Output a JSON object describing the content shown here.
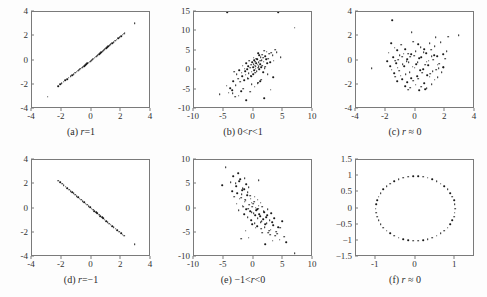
{
  "figure": {
    "background_color": "#fdfdfd",
    "frame_color": "#7a7a7a",
    "point_color": "#1a1a1a",
    "panel_count": 6
  },
  "chart_data": [
    {
      "type": "scatter",
      "panel": "a",
      "caption_prefix": "(a)",
      "caption_symbol": "r",
      "caption_relation": "=1",
      "caption": "(a) r=1",
      "title": "",
      "xlabel": "",
      "ylabel": "",
      "xlim": [
        -4,
        4
      ],
      "ylim": [
        -4,
        4
      ],
      "xticks": [
        -4,
        -2,
        0,
        2,
        4
      ],
      "yticks": [
        -4,
        -2,
        0,
        2,
        4
      ],
      "grid": false,
      "legend": "none",
      "correlation": 1,
      "x": [
        -2.95,
        -2.25,
        -2.12,
        -2.0,
        -1.88,
        -1.76,
        -1.64,
        -1.52,
        -1.4,
        -1.3,
        -1.2,
        -1.1,
        -1.0,
        -0.9,
        -0.82,
        -0.74,
        -0.66,
        -0.58,
        -0.5,
        -0.42,
        -0.35,
        -0.28,
        -0.2,
        -0.13,
        -0.06,
        0.0,
        0.07,
        0.14,
        0.21,
        0.28,
        0.35,
        0.43,
        0.5,
        0.58,
        0.66,
        0.74,
        0.82,
        0.9,
        0.98,
        1.06,
        1.14,
        1.22,
        1.3,
        1.4,
        1.5,
        1.6,
        1.7,
        1.8,
        1.9,
        2.0,
        2.1,
        2.2,
        2.22,
        2.9
      ],
      "y": [
        -3.0,
        -2.1,
        -1.97,
        -1.86,
        -1.74,
        -1.63,
        -1.52,
        -1.41,
        -1.29,
        -1.2,
        -1.11,
        -1.02,
        -0.93,
        -0.84,
        -0.76,
        -0.68,
        -0.61,
        -0.53,
        -0.46,
        -0.38,
        -0.31,
        -0.24,
        -0.17,
        -0.1,
        -0.04,
        0.02,
        0.09,
        0.16,
        0.23,
        0.3,
        0.37,
        0.45,
        0.52,
        0.6,
        0.68,
        0.76,
        0.84,
        0.92,
        1.0,
        1.08,
        1.16,
        1.24,
        1.32,
        1.42,
        1.52,
        1.62,
        1.72,
        1.82,
        1.92,
        2.02,
        2.12,
        2.22,
        2.3,
        3.1
      ]
    },
    {
      "type": "scatter",
      "panel": "b",
      "caption_prefix": "(b)",
      "caption_symbol": "r",
      "caption_relation": "0<r<1",
      "caption": "(b) 0<r<1",
      "title": "",
      "xlabel": "",
      "ylabel": "",
      "xlim": [
        -10,
        10
      ],
      "ylim": [
        -10,
        15
      ],
      "xticks": [
        -10,
        -5,
        0,
        5,
        10
      ],
      "yticks": [
        -10,
        -5,
        0,
        5,
        10,
        15
      ],
      "grid": false,
      "legend": "none",
      "correlation": 0.65,
      "x": [
        6.9,
        4.6,
        3.9,
        3.6,
        3.4,
        3.2,
        3.0,
        2.8,
        2.6,
        2.5,
        2.3,
        2.2,
        2.1,
        2.0,
        1.9,
        1.8,
        1.7,
        1.6,
        1.5,
        1.45,
        1.4,
        1.3,
        1.2,
        1.15,
        1.1,
        1.0,
        0.95,
        0.9,
        0.85,
        0.8,
        0.75,
        0.7,
        0.6,
        0.55,
        0.5,
        0.45,
        0.4,
        0.3,
        0.25,
        0.2,
        0.15,
        0.1,
        0.05,
        0.0,
        -0.05,
        -0.1,
        -0.2,
        -0.3,
        -0.4,
        -0.5,
        -0.6,
        -0.7,
        -0.8,
        -0.9,
        -1.0,
        -1.1,
        -1.2,
        -1.3,
        -1.4,
        -1.5,
        -1.6,
        -1.8,
        -1.9,
        -2.0,
        -2.2,
        -2.4,
        -2.6,
        -2.8,
        -3.0,
        -3.2,
        -3.4,
        -3.6,
        -3.9,
        -4.2,
        -4.5,
        -5.7,
        -0.6,
        0.8,
        1.3,
        -1.7,
        2.4,
        -2.5,
        0.2,
        1.6,
        -0.3,
        2.9,
        -3.5,
        1.1,
        0.4,
        -1.2,
        3.3,
        -0.9,
        2.0,
        -2.1,
        0.7,
        1.8,
        -0.4,
        -3.1,
        4.2,
        -4.4
      ],
      "y": [
        11.0,
        3.4,
        4.6,
        5.3,
        2.4,
        3.8,
        4.5,
        2.0,
        4.2,
        3.0,
        1.8,
        4.8,
        2.8,
        3.6,
        0.5,
        5.0,
        2.2,
        3.2,
        1.2,
        4.0,
        2.6,
        0.8,
        3.4,
        1.6,
        2.4,
        0.2,
        3.8,
        1.0,
        2.0,
        4.4,
        0.6,
        1.4,
        2.8,
        -0.2,
        1.8,
        3.0,
        0.4,
        2.2,
        -0.6,
        1.2,
        2.6,
        0.0,
        1.6,
        3.2,
        -1.0,
        0.8,
        2.0,
        -0.4,
        1.4,
        -1.4,
        0.6,
        2.4,
        -0.8,
        1.0,
        -2.0,
        0.2,
        1.8,
        -1.2,
        -0.2,
        0.4,
        -2.6,
        1.2,
        -1.6,
        -0.6,
        -3.0,
        0.0,
        -2.2,
        -1.0,
        -3.8,
        -0.4,
        -2.8,
        -5.2,
        -4.6,
        -5.8,
        -4.0,
        -6.2,
        -5.5,
        -3.2,
        -2.4,
        -4.8,
        -1.0,
        -6.6,
        -4.2,
        -0.5,
        -3.6,
        -5.0,
        -6.0,
        -2.8,
        1.0,
        -7.8,
        -1.8,
        -2.2,
        0.9,
        -5.4,
        -3.4,
        -7.2,
        -1.6,
        -6.8
      ]
    },
    {
      "type": "scatter",
      "panel": "c",
      "caption_prefix": "(c)",
      "caption_symbol": "r",
      "caption_relation": "≈ 0",
      "caption": "(c) r ≈ 0",
      "title": "",
      "xlabel": "",
      "ylabel": "",
      "xlim": [
        -4,
        4
      ],
      "ylim": [
        -4,
        4
      ],
      "xticks": [
        -4,
        -2,
        0,
        2,
        4
      ],
      "yticks": [
        -4,
        -2,
        0,
        2,
        4
      ],
      "grid": false,
      "legend": "none",
      "correlation": 0.0,
      "x": [
        -1.55,
        2.9,
        2.2,
        -0.25,
        1.35,
        -2.95,
        -1.65,
        -1.25,
        -0.95,
        -0.5,
        -0.15,
        0.2,
        0.6,
        0.95,
        1.3,
        1.7,
        2.1,
        -1.8,
        -1.4,
        -1.05,
        -0.7,
        -0.35,
        0.0,
        0.35,
        0.7,
        1.05,
        1.45,
        1.85,
        -1.9,
        -1.5,
        -1.15,
        -0.8,
        -0.45,
        -0.1,
        0.25,
        0.55,
        0.9,
        1.25,
        1.6,
        2.0,
        -1.7,
        -1.3,
        -0.9,
        -0.6,
        -0.3,
        0.05,
        0.4,
        0.75,
        1.1,
        1.5,
        1.9,
        -1.6,
        -1.2,
        -0.85,
        -0.55,
        -0.2,
        0.15,
        0.5,
        0.85,
        1.2,
        1.55,
        -1.45,
        -1.1,
        -0.75,
        -0.4,
        -0.05,
        0.3,
        0.65,
        1.0,
        1.4,
        1.75,
        -1.35,
        -1.0,
        -0.65,
        -0.3,
        0.1,
        0.45,
        0.8,
        1.15,
        1.5,
        -1.25,
        -0.9,
        -0.55,
        -0.15,
        0.2,
        0.6,
        0.95,
        1.3,
        -0.7,
        -0.35,
        0.0,
        0.4,
        0.75,
        1.1,
        -0.5,
        0.25,
        0.65,
        1.85,
        -1.35
      ],
      "y": [
        3.3,
        2.1,
        1.95,
        2.35,
        1.9,
        -0.65,
        1.45,
        0.85,
        1.3,
        0.55,
        1.55,
        1.35,
        0.95,
        1.45,
        1.2,
        1.5,
        0.75,
        0.65,
        1.05,
        0.45,
        0.95,
        0.3,
        0.75,
        1.1,
        0.6,
        0.9,
        0.35,
        0.5,
        -0.05,
        0.25,
        0.05,
        0.55,
        -0.15,
        0.4,
        0.2,
        0.7,
        0.0,
        0.45,
        -0.25,
        0.15,
        -0.45,
        -0.2,
        0.3,
        -0.05,
        0.5,
        -0.3,
        0.25,
        -0.1,
        0.35,
        -0.35,
        -0.55,
        -0.75,
        -0.6,
        -0.3,
        0.1,
        -0.5,
        -0.15,
        -0.7,
        -0.4,
        0.05,
        -0.65,
        -1.05,
        -0.85,
        -0.45,
        -0.95,
        -0.6,
        -0.8,
        -0.35,
        -1.1,
        -0.75,
        -0.95,
        -1.35,
        -1.25,
        -1.15,
        -1.45,
        -1.3,
        -1.0,
        -1.2,
        -0.9,
        -1.4,
        -1.7,
        -1.55,
        -1.8,
        -1.65,
        -1.5,
        -1.85,
        -1.35,
        -1.6,
        -2.1,
        -2.25,
        -2.0,
        -2.15,
        -2.3,
        -1.95,
        -2.4,
        -2.45,
        -2.35,
        -0.55,
        0.0
      ]
    },
    {
      "type": "scatter",
      "panel": "d",
      "caption_prefix": "(d)",
      "caption_symbol": "r",
      "caption_relation": "=−1",
      "caption": "(d) r=−1",
      "title": "",
      "xlabel": "",
      "ylabel": "",
      "xlim": [
        -4,
        4
      ],
      "ylim": [
        -4,
        4
      ],
      "xticks": [
        -4,
        -2,
        0,
        2,
        4
      ],
      "yticks": [
        -4,
        -2,
        0,
        2,
        4
      ],
      "grid": false,
      "legend": "none",
      "correlation": -1,
      "x": [
        -2.25,
        -2.1,
        -1.98,
        -1.86,
        -1.74,
        -1.62,
        -1.5,
        -1.4,
        -1.3,
        -1.2,
        -1.1,
        -1.0,
        -0.9,
        -0.8,
        -0.7,
        -0.6,
        -0.5,
        -0.4,
        -0.3,
        -0.2,
        -0.1,
        0.0,
        0.1,
        0.2,
        0.3,
        0.4,
        0.5,
        0.6,
        0.7,
        0.8,
        0.9,
        1.0,
        1.1,
        1.2,
        1.3,
        1.4,
        1.5,
        1.62,
        1.74,
        1.86,
        1.98,
        2.1,
        2.2,
        2.9
      ],
      "y": [
        2.3,
        2.15,
        2.03,
        1.91,
        1.79,
        1.67,
        1.55,
        1.44,
        1.34,
        1.24,
        1.13,
        1.03,
        0.93,
        0.82,
        0.72,
        0.62,
        0.51,
        0.41,
        0.31,
        0.2,
        0.1,
        0.0,
        -0.1,
        -0.21,
        -0.31,
        -0.41,
        -0.52,
        -0.62,
        -0.72,
        -0.82,
        -0.93,
        -1.03,
        -1.13,
        -1.24,
        -1.34,
        -1.44,
        -1.55,
        -1.67,
        -1.79,
        -1.91,
        -2.03,
        -2.15,
        -2.25,
        -2.95
      ]
    },
    {
      "type": "scatter",
      "panel": "e",
      "caption_prefix": "(e)",
      "caption_symbol": "r",
      "caption_relation": "−1<r<0",
      "caption": "(e) −1<r<0",
      "title": "",
      "xlabel": "",
      "ylabel": "",
      "xlim": [
        -10,
        10
      ],
      "ylim": [
        -10,
        10
      ],
      "xticks": [
        -10,
        -5,
        0,
        5,
        10
      ],
      "yticks": [
        -10,
        -5,
        0,
        5,
        10
      ],
      "grid": false,
      "legend": "none",
      "correlation": -0.7,
      "x": [
        -4.7,
        -5.3,
        -3.4,
        -2.6,
        -3.0,
        -2.2,
        -1.8,
        -3.6,
        -2.9,
        -2.4,
        -2.0,
        -1.6,
        -1.2,
        -3.2,
        -2.7,
        -2.3,
        -1.9,
        -1.5,
        -1.1,
        -0.8,
        -2.8,
        -2.1,
        -1.7,
        -1.4,
        -1.0,
        -0.6,
        -0.3,
        -2.5,
        -1.8,
        -1.3,
        -0.9,
        -0.5,
        -0.1,
        0.2,
        -1.6,
        -1.2,
        -0.7,
        -0.3,
        0.1,
        0.4,
        0.7,
        -1.0,
        -0.6,
        -0.2,
        0.3,
        0.6,
        0.9,
        1.2,
        -0.4,
        0.0,
        0.5,
        0.8,
        1.1,
        1.5,
        1.8,
        0.2,
        0.7,
        1.0,
        1.4,
        1.7,
        2.1,
        2.4,
        0.6,
        1.2,
        1.6,
        2.0,
        2.3,
        2.7,
        3.0,
        1.3,
        1.9,
        2.2,
        2.6,
        3.1,
        3.5,
        2.5,
        2.9,
        3.3,
        3.8,
        4.2,
        4.8,
        3.6,
        4.0,
        4.5,
        5.2,
        6.9,
        -1.3,
        -0.2,
        2.8,
        0.4,
        -2.1,
        1.5,
        3.2,
        -0.8,
        5.5,
        4.4,
        0.9,
        -3.8,
        2.0,
        -1.5
      ],
      "y": [
        8.5,
        4.8,
        6.6,
        7.3,
        5.2,
        6.0,
        4.2,
        3.6,
        4.6,
        5.6,
        3.0,
        4.0,
        5.0,
        2.4,
        3.2,
        2.0,
        3.8,
        1.4,
        2.8,
        4.4,
        1.0,
        2.2,
        0.4,
        1.8,
        3.4,
        2.6,
        1.2,
        -0.4,
        0.6,
        1.6,
        0.0,
        2.0,
        1.0,
        2.4,
        -1.2,
        -0.2,
        0.8,
        -0.8,
        1.4,
        0.2,
        1.8,
        -1.8,
        -0.6,
        0.4,
        -1.4,
        -0.2,
        0.6,
        1.2,
        -2.4,
        -1.0,
        -0.4,
        0.0,
        -1.6,
        0.4,
        -0.8,
        -3.0,
        -2.0,
        -1.2,
        -2.6,
        -0.6,
        -1.8,
        -0.2,
        -3.6,
        -2.8,
        -2.2,
        -3.2,
        -1.4,
        -2.4,
        -1.0,
        -4.2,
        -3.8,
        -3.0,
        -4.6,
        -2.8,
        -2.0,
        -5.0,
        -4.4,
        -3.4,
        -4.8,
        -3.8,
        -2.6,
        -5.6,
        -5.2,
        -4.0,
        -5.8,
        -9.2,
        -4.6,
        -3.2,
        -5.4,
        -4.0,
        -6.2,
        -5.0,
        -6.6,
        -6.0,
        -7.0,
        -6.4,
        5.8,
        5.4,
        -7.4,
        6.2
      ]
    },
    {
      "type": "scatter",
      "panel": "f",
      "caption_prefix": "(f)",
      "caption_symbol": "r",
      "caption_relation": "≈ 0",
      "caption": "(f) r ≈ 0",
      "title": "",
      "xlabel": "",
      "ylabel": "",
      "xlim": [
        -1.5,
        1.5
      ],
      "ylim": [
        -1.5,
        1.5
      ],
      "xticks": [
        -1,
        0,
        1
      ],
      "yticks": [
        -1.5,
        -1,
        -0.5,
        0,
        0.5,
        1,
        1.5
      ],
      "ytick_labels": [
        "-1.5",
        "-1",
        "-0.5",
        "0",
        "0.5",
        "1",
        "1.5"
      ],
      "grid": false,
      "legend": "none",
      "correlation": 0.0,
      "shape": "circle",
      "radius": 1.0,
      "n_points": 50
    }
  ]
}
